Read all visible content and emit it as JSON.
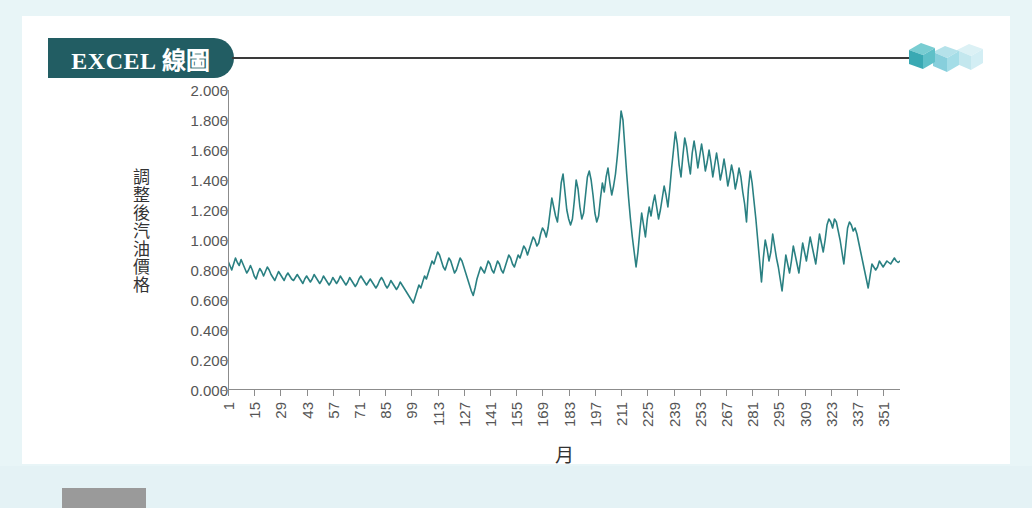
{
  "page": {
    "background_color": "#ffffff",
    "frame_color": "#e8f5f7",
    "panel_color": "#ffffff"
  },
  "banner": {
    "label": "EXCEL 線圖",
    "background_color": "#225d63",
    "text_color": "#ffffff",
    "rule_color": "#3a3a3a"
  },
  "decoration": {
    "cubes_icon": "three-cubes-icon",
    "cube_colors": [
      "#3fb5b8",
      "#8ed8e0",
      "#c6e9ef"
    ]
  },
  "chart_data": {
    "type": "line",
    "title": "",
    "xlabel": "月",
    "ylabel": "調整後汽油價格",
    "ylim": [
      0.0,
      2.0
    ],
    "yticks": [
      "0.000",
      "0.200",
      "0.400",
      "0.600",
      "0.800",
      "1.000",
      "1.200",
      "1.400",
      "1.600",
      "1.800",
      "2.000"
    ],
    "ytick_values": [
      0.0,
      0.2,
      0.4,
      0.6,
      0.8,
      1.0,
      1.2,
      1.4,
      1.6,
      1.8,
      2.0
    ],
    "xlim": [
      1,
      360
    ],
    "xticks": [
      1,
      15,
      29,
      43,
      57,
      71,
      85,
      99,
      113,
      127,
      141,
      155,
      169,
      183,
      197,
      211,
      225,
      239,
      253,
      267,
      281,
      295,
      309,
      323,
      337,
      351
    ],
    "xtick_labels": [
      "1",
      "15",
      "29",
      "43",
      "57",
      "71",
      "85",
      "99",
      "113",
      "127",
      "141",
      "155",
      "169",
      "183",
      "197",
      "211",
      "225",
      "239",
      "253",
      "267",
      "281",
      "295",
      "309",
      "323",
      "337",
      "351"
    ],
    "grid": false,
    "legend": "none",
    "line_color": "#2a8082",
    "line_width": 1.6,
    "series": [
      {
        "name": "調整後汽油價格",
        "x_start": 1,
        "x_step": 1,
        "values": [
          0.86,
          0.83,
          0.8,
          0.84,
          0.88,
          0.85,
          0.83,
          0.87,
          0.84,
          0.81,
          0.78,
          0.8,
          0.83,
          0.8,
          0.76,
          0.74,
          0.78,
          0.81,
          0.79,
          0.76,
          0.79,
          0.82,
          0.8,
          0.77,
          0.75,
          0.73,
          0.76,
          0.79,
          0.77,
          0.75,
          0.73,
          0.76,
          0.78,
          0.76,
          0.74,
          0.73,
          0.75,
          0.77,
          0.75,
          0.73,
          0.71,
          0.74,
          0.76,
          0.74,
          0.72,
          0.74,
          0.77,
          0.75,
          0.73,
          0.71,
          0.73,
          0.76,
          0.74,
          0.72,
          0.7,
          0.72,
          0.75,
          0.73,
          0.71,
          0.73,
          0.76,
          0.74,
          0.72,
          0.7,
          0.72,
          0.75,
          0.73,
          0.71,
          0.69,
          0.71,
          0.74,
          0.76,
          0.74,
          0.72,
          0.7,
          0.72,
          0.74,
          0.72,
          0.7,
          0.68,
          0.7,
          0.73,
          0.75,
          0.73,
          0.7,
          0.68,
          0.7,
          0.73,
          0.71,
          0.69,
          0.67,
          0.69,
          0.72,
          0.7,
          0.68,
          0.66,
          0.64,
          0.62,
          0.6,
          0.58,
          0.62,
          0.66,
          0.7,
          0.68,
          0.72,
          0.76,
          0.74,
          0.78,
          0.82,
          0.86,
          0.84,
          0.88,
          0.92,
          0.9,
          0.86,
          0.82,
          0.8,
          0.84,
          0.88,
          0.86,
          0.82,
          0.78,
          0.8,
          0.84,
          0.88,
          0.86,
          0.82,
          0.78,
          0.74,
          0.7,
          0.66,
          0.63,
          0.68,
          0.74,
          0.78,
          0.82,
          0.8,
          0.78,
          0.82,
          0.86,
          0.84,
          0.8,
          0.78,
          0.82,
          0.86,
          0.84,
          0.8,
          0.78,
          0.82,
          0.86,
          0.9,
          0.88,
          0.84,
          0.82,
          0.86,
          0.9,
          0.88,
          0.92,
          0.96,
          0.94,
          0.9,
          0.94,
          0.98,
          1.02,
          1.0,
          0.96,
          0.98,
          1.04,
          1.08,
          1.06,
          1.02,
          1.08,
          1.18,
          1.28,
          1.22,
          1.16,
          1.12,
          1.24,
          1.38,
          1.44,
          1.32,
          1.2,
          1.14,
          1.1,
          1.14,
          1.26,
          1.4,
          1.34,
          1.22,
          1.14,
          1.18,
          1.3,
          1.42,
          1.46,
          1.4,
          1.3,
          1.18,
          1.12,
          1.16,
          1.28,
          1.38,
          1.32,
          1.42,
          1.48,
          1.38,
          1.3,
          1.36,
          1.44,
          1.56,
          1.7,
          1.86,
          1.8,
          1.62,
          1.44,
          1.28,
          1.14,
          1.02,
          0.92,
          0.82,
          0.92,
          1.06,
          1.18,
          1.1,
          1.02,
          1.14,
          1.22,
          1.16,
          1.24,
          1.3,
          1.22,
          1.14,
          1.2,
          1.28,
          1.36,
          1.3,
          1.22,
          1.34,
          1.48,
          1.6,
          1.72,
          1.64,
          1.5,
          1.42,
          1.56,
          1.68,
          1.62,
          1.52,
          1.44,
          1.58,
          1.66,
          1.58,
          1.48,
          1.56,
          1.64,
          1.56,
          1.46,
          1.52,
          1.6,
          1.52,
          1.42,
          1.5,
          1.58,
          1.5,
          1.4,
          1.46,
          1.54,
          1.46,
          1.36,
          1.42,
          1.5,
          1.44,
          1.34,
          1.4,
          1.48,
          1.42,
          1.32,
          1.24,
          1.12,
          1.34,
          1.46,
          1.38,
          1.26,
          1.14,
          1.0,
          0.86,
          0.72,
          0.88,
          1.0,
          0.94,
          0.86,
          0.92,
          1.04,
          0.96,
          0.88,
          0.82,
          0.74,
          0.66,
          0.78,
          0.9,
          0.84,
          0.78,
          0.86,
          0.96,
          0.9,
          0.84,
          0.78,
          0.88,
          0.98,
          0.92,
          0.86,
          0.94,
          1.02,
          0.96,
          0.9,
          0.84,
          0.94,
          1.04,
          0.98,
          0.92,
          1.0,
          1.1,
          1.14,
          1.12,
          1.08,
          1.14,
          1.12,
          1.06,
          1.0,
          0.92,
          0.84,
          0.96,
          1.08,
          1.12,
          1.1,
          1.06,
          1.08,
          1.04,
          0.98,
          0.92,
          0.86,
          0.8,
          0.74,
          0.68,
          0.76,
          0.84,
          0.82,
          0.8,
          0.82,
          0.86,
          0.84,
          0.82,
          0.84,
          0.86,
          0.85,
          0.84,
          0.86,
          0.88,
          0.86,
          0.85,
          0.86
        ]
      }
    ]
  }
}
